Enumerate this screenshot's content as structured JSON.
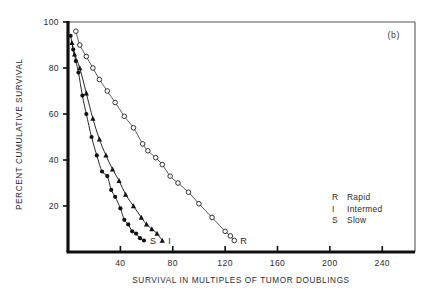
{
  "panel": {
    "label": "(b)"
  },
  "axes": {
    "ylabel": "PERCENT CUMULATIVE SURVIVAL",
    "xlabel": "SURVIVAL IN MULTIPLES OF TUMOR DOUBLINGS",
    "y_ticks": [
      "20",
      "40",
      "60",
      "80",
      "100"
    ],
    "x_ticks": [
      "40",
      "80",
      "120",
      "160",
      "200",
      "240"
    ]
  },
  "legend": {
    "entries": [
      {
        "key": "R",
        "label": "Rapid"
      },
      {
        "key": "I",
        "label": "Intermed"
      },
      {
        "key": "S",
        "label": "Slow"
      }
    ]
  },
  "curve_labels": {
    "slow": "S",
    "intermed": "I",
    "rapid": "R"
  },
  "chart_data": {
    "type": "scatter",
    "title": "",
    "subtitle": "",
    "panel_label": "(b)",
    "xlabel": "SURVIVAL IN MULTIPLES OF TUMOR DOUBLINGS",
    "ylabel": "PERCENT CUMULATIVE SURVIVAL",
    "xlim": [
      0,
      265
    ],
    "ylim": [
      0,
      100
    ],
    "xticks": [
      40,
      80,
      120,
      160,
      200,
      240
    ],
    "yticks": [
      20,
      40,
      60,
      80,
      100
    ],
    "grid": false,
    "legend_position": "right-lower",
    "series": [
      {
        "name": "Slow",
        "key": "S",
        "marker": "filled-circle",
        "color": "#111111",
        "end_label": "S",
        "points": [
          {
            "x": 2,
            "y": 94
          },
          {
            "x": 4,
            "y": 88
          },
          {
            "x": 6,
            "y": 83
          },
          {
            "x": 8,
            "y": 78
          },
          {
            "x": 11,
            "y": 68
          },
          {
            "x": 14,
            "y": 60
          },
          {
            "x": 18,
            "y": 50
          },
          {
            "x": 22,
            "y": 42
          },
          {
            "x": 26,
            "y": 35
          },
          {
            "x": 30,
            "y": 33
          },
          {
            "x": 33,
            "y": 27
          },
          {
            "x": 36,
            "y": 24
          },
          {
            "x": 40,
            "y": 19
          },
          {
            "x": 43,
            "y": 14
          },
          {
            "x": 46,
            "y": 12
          },
          {
            "x": 49,
            "y": 9
          },
          {
            "x": 52,
            "y": 8
          },
          {
            "x": 55,
            "y": 6
          },
          {
            "x": 58,
            "y": 5
          }
        ]
      },
      {
        "name": "Intermed",
        "key": "I",
        "marker": "filled-triangle",
        "color": "#111111",
        "end_label": "I",
        "points": [
          {
            "x": 3,
            "y": 91
          },
          {
            "x": 5,
            "y": 86
          },
          {
            "x": 9,
            "y": 80
          },
          {
            "x": 14,
            "y": 69
          },
          {
            "x": 19,
            "y": 58
          },
          {
            "x": 24,
            "y": 49
          },
          {
            "x": 29,
            "y": 42
          },
          {
            "x": 34,
            "y": 36
          },
          {
            "x": 39,
            "y": 31
          },
          {
            "x": 44,
            "y": 25
          },
          {
            "x": 50,
            "y": 20
          },
          {
            "x": 56,
            "y": 15
          },
          {
            "x": 60,
            "y": 12
          },
          {
            "x": 64,
            "y": 10
          },
          {
            "x": 68,
            "y": 8
          },
          {
            "x": 72,
            "y": 5
          }
        ]
      },
      {
        "name": "Rapid",
        "key": "R",
        "marker": "open-circle",
        "color": "#111111",
        "end_label": "R",
        "points": [
          {
            "x": 6,
            "y": 96
          },
          {
            "x": 9,
            "y": 90
          },
          {
            "x": 14,
            "y": 85
          },
          {
            "x": 19,
            "y": 80
          },
          {
            "x": 24,
            "y": 75
          },
          {
            "x": 30,
            "y": 70
          },
          {
            "x": 36,
            "y": 65
          },
          {
            "x": 43,
            "y": 59
          },
          {
            "x": 50,
            "y": 54
          },
          {
            "x": 57,
            "y": 47
          },
          {
            "x": 61,
            "y": 44
          },
          {
            "x": 67,
            "y": 41
          },
          {
            "x": 72,
            "y": 38
          },
          {
            "x": 78,
            "y": 33
          },
          {
            "x": 84,
            "y": 30
          },
          {
            "x": 92,
            "y": 26
          },
          {
            "x": 100,
            "y": 21
          },
          {
            "x": 110,
            "y": 15
          },
          {
            "x": 120,
            "y": 9
          },
          {
            "x": 124,
            "y": 7
          },
          {
            "x": 127,
            "y": 5
          }
        ]
      }
    ]
  }
}
